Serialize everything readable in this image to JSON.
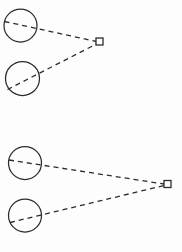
{
  "canvas": {
    "width": 182,
    "height": 252,
    "background_color": "#fdfdfd",
    "stroke_color": "#2b2b2b",
    "title": "Two-view triangulation geometry diagram"
  },
  "style": {
    "circle_stroke_width": 1.25,
    "square_stroke_width": 1.3,
    "ray_stroke_width": 1.3,
    "dash_pattern": "5 4",
    "circle_fill": "none",
    "square_fill": "#ffffff"
  },
  "groups": [
    {
      "name": "upper-configuration",
      "label": "upper group",
      "target": {
        "name": "square-marker",
        "cx": 99.5,
        "cy": 41.5,
        "size": 7
      },
      "circles": [
        {
          "name": "circle-upper-a",
          "cx": 20.5,
          "cy": 25.5,
          "r": 16.5
        },
        {
          "name": "circle-upper-b",
          "cx": 22.5,
          "cy": 78.5,
          "r": 17.0
        }
      ],
      "rays": [
        {
          "name": "ray-upper-a",
          "x1": 4.5,
          "y1": 21.5,
          "x2": 96.5,
          "y2": 41.5
        },
        {
          "name": "ray-upper-b",
          "x1": 7.5,
          "y1": 89.5,
          "x2": 96.5,
          "y2": 44.0
        }
      ]
    },
    {
      "name": "lower-configuration",
      "label": "lower group",
      "target": {
        "name": "square-marker",
        "cx": 167.5,
        "cy": 184.0,
        "size": 7
      },
      "circles": [
        {
          "name": "circle-lower-a",
          "cx": 25.0,
          "cy": 163.0,
          "r": 16.5
        },
        {
          "name": "circle-lower-b",
          "cx": 25.0,
          "cy": 215.5,
          "r": 16.5
        }
      ],
      "rays": [
        {
          "name": "ray-lower-a",
          "x1": 9.0,
          "y1": 160.0,
          "x2": 164.0,
          "y2": 184.0
        },
        {
          "name": "ray-lower-b",
          "x1": 10.0,
          "y1": 222.5,
          "x2": 164.0,
          "y2": 185.5
        }
      ]
    }
  ]
}
